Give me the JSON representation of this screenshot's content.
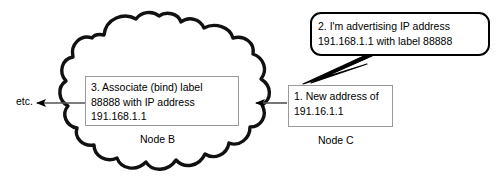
{
  "diagram": {
    "background_color": "#ffffff",
    "line_color": "#000000",
    "box_border_color": "#9a9a9a"
  },
  "cloud": {
    "name": "network-cloud",
    "label": "Node B"
  },
  "nodes": {
    "node_b_label": "Node B",
    "node_c_label": "Node C"
  },
  "boxes": {
    "bind_note": "3. Associate (bind) label\n88888 with IP address\n191.168.1.1",
    "new_address_note": "1. New address of\n191.16.1.1"
  },
  "bubble": {
    "text": "2. I'm  advertising IP address\n191.168.1.1 with label 88888"
  },
  "annotations": {
    "etc_label": "etc."
  }
}
